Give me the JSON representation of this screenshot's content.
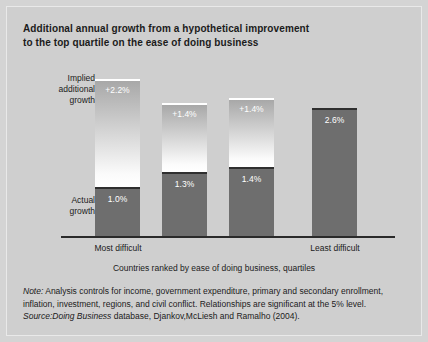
{
  "title": {
    "line1": "Additional annual growth from a hypothetical improvement",
    "line2": "to the top quartile on the ease of doing business"
  },
  "legend": {
    "implied_line1": "Implied",
    "implied_line2": "additional",
    "implied_line3": "growth",
    "actual_line1": "Actual",
    "actual_line2": "growth"
  },
  "axis": {
    "caption": "Countries ranked by ease of doing business, quartiles",
    "first_label": "Most difficult",
    "last_label": "Least difficult"
  },
  "footnotes": {
    "note_prefix": "Note:",
    "note_body": " Analysis controls for income, government expenditure, primary and secondary enrollment, inflation, investment, regions, and civil conflict. Relationships are significant at the 5% level.",
    "source_prefix": "Source:",
    "source_italic": "Doing Business",
    "source_body": " database, Djankov,McLiesh and Ramalho (2004)."
  },
  "colors": {
    "background": "#cfcfcf",
    "actual_bar": "#6e6e6e",
    "implied_top": "#a8a8a8",
    "implied_bottom": "#ffffff",
    "axis": "#2a2a2a",
    "text": "#1b1b1b",
    "bar_value_text": "#ffffff"
  },
  "chart_data": {
    "type": "bar",
    "subtype": "stacked",
    "title": "Additional annual growth from a hypothetical improvement to the top quartile on the ease of doing business",
    "xlabel": "Countries ranked by ease of doing business, quartiles",
    "ylabel": "",
    "ylim": [
      0,
      3.4
    ],
    "grid": false,
    "legend_position": "left-axis-annotations",
    "categories": [
      "Most difficult",
      "",
      "",
      "Least difficult"
    ],
    "series": [
      {
        "name": "Actual growth",
        "values": [
          1.0,
          1.3,
          1.4,
          2.6
        ],
        "labels": [
          "1.0%",
          "1.3%",
          "1.4%",
          "2.6%"
        ]
      },
      {
        "name": "Implied additional growth",
        "values": [
          2.2,
          1.4,
          1.4,
          0
        ],
        "labels": [
          "+2.2%",
          "+1.4%",
          "+1.4%",
          ""
        ]
      }
    ],
    "totals": [
      3.2,
      2.7,
      2.8,
      2.6
    ],
    "bars": [
      {
        "category": "Most difficult",
        "actual": 1.0,
        "actual_label": "1.0%",
        "implied": 2.2,
        "implied_label": "+2.2%"
      },
      {
        "category": "",
        "actual": 1.3,
        "actual_label": "1.3%",
        "implied": 1.4,
        "implied_label": "+1.4%"
      },
      {
        "category": "",
        "actual": 1.4,
        "actual_label": "1.4%",
        "implied": 1.4,
        "implied_label": "+1.4%"
      },
      {
        "category": "Least difficult",
        "actual": 2.6,
        "actual_label": "2.6%",
        "implied": 0,
        "implied_label": ""
      }
    ]
  }
}
